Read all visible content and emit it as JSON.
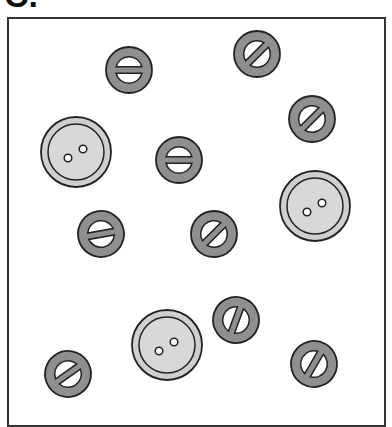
{
  "figure": {
    "label": "C.",
    "frame_color": "#333333"
  },
  "colors": {
    "large_fill": "#cfcfcf",
    "large_inner": "#d8d8d8",
    "small_fill": "#8f8f8f",
    "stroke": "#222222",
    "hole": "#ffffff"
  },
  "buttons": {
    "large": [
      {
        "x": 76,
        "y": 152,
        "r": 35
      },
      {
        "x": 315,
        "y": 206,
        "r": 35
      },
      {
        "x": 167,
        "y": 345,
        "r": 35
      }
    ],
    "small": [
      {
        "x": 129,
        "y": 70,
        "r": 23,
        "angle": 0
      },
      {
        "x": 257,
        "y": 54,
        "r": 23,
        "angle": -45
      },
      {
        "x": 312,
        "y": 119,
        "r": 23,
        "angle": -45
      },
      {
        "x": 179,
        "y": 160,
        "r": 23,
        "angle": 0
      },
      {
        "x": 101,
        "y": 234,
        "r": 23,
        "angle": -10
      },
      {
        "x": 214,
        "y": 234,
        "r": 23,
        "angle": -45
      },
      {
        "x": 236,
        "y": 320,
        "r": 23,
        "angle": -70
      },
      {
        "x": 68,
        "y": 374,
        "r": 23,
        "angle": -35
      },
      {
        "x": 314,
        "y": 364,
        "r": 23,
        "angle": -60
      }
    ]
  }
}
